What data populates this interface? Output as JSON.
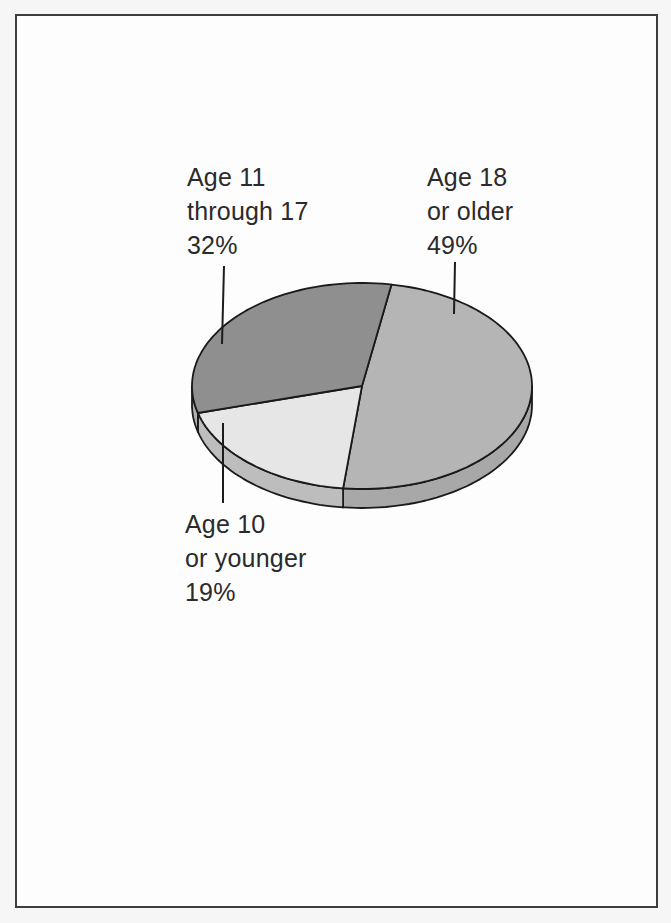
{
  "chart_data": {
    "type": "pie",
    "style": "3d-oblique",
    "title": "",
    "legend_position": "none",
    "labels_placement": "external-with-leader-lines",
    "unit": "percent",
    "start_angle_deg": 80,
    "clockwise": true,
    "slices": [
      {
        "name": "Age 18 or older",
        "label_lines": [
          "Age 18",
          "or older"
        ],
        "value": 49,
        "percent_label": "49%",
        "color": "#b5b5b5",
        "side_color": "#a8a8a8"
      },
      {
        "name": "Age 10 or younger",
        "label_lines": [
          "Age 10",
          "or younger"
        ],
        "value": 19,
        "percent_label": "19%",
        "color": "#e6e6e6",
        "side_color": "#bdbdbd"
      },
      {
        "name": "Age 11 through 17",
        "label_lines": [
          "Age 11",
          "through 17"
        ],
        "value": 32,
        "percent_label": "32%",
        "color": "#8f8f8f",
        "side_color": "#b0b0b0"
      }
    ]
  }
}
